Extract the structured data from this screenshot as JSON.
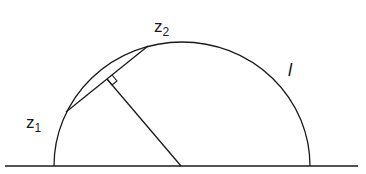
{
  "diagram": {
    "type": "hyperbolic-geodesic-semicircle",
    "labels": {
      "z1": {
        "main": "z",
        "sub": "1"
      },
      "z2": {
        "main": "z",
        "sub": "2"
      },
      "geodesic": "l"
    },
    "colors": {
      "stroke": "#1a1a1a",
      "background": "#ffffff"
    },
    "geometry": {
      "baseline": {
        "x1": 5,
        "x2": 358,
        "y": 166
      },
      "semicircle_center": [
        182,
        166
      ],
      "semicircle_radius": 128,
      "z1_point": [
        66,
        112
      ],
      "z2_point": [
        148,
        46
      ],
      "perpendicular_foot": [
        107,
        79
      ]
    }
  }
}
